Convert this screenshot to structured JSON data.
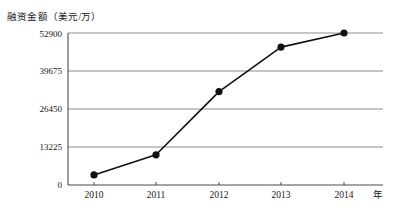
{
  "chart_data": {
    "type": "line",
    "title": "",
    "ylabel": "融资金额（美元/万）",
    "xlabel": "年",
    "categories": [
      "2010",
      "2011",
      "2012",
      "2013",
      "2014"
    ],
    "values": [
      3500,
      10500,
      32500,
      48000,
      52900
    ],
    "ytick_labels": [
      "0",
      "13225",
      "26450",
      "39675",
      "52900"
    ],
    "ytick_values": [
      0,
      13225,
      26450,
      39675,
      52900
    ],
    "ylim": [
      0,
      52900
    ],
    "grid": "horizontal",
    "legend": "none",
    "series": [
      {
        "name": "融资金额",
        "values": [
          3500,
          10500,
          32500,
          48000,
          52900
        ]
      }
    ],
    "marker": "filled-circle",
    "line_color": "#111111",
    "grid_color": "#8c8c8c"
  }
}
